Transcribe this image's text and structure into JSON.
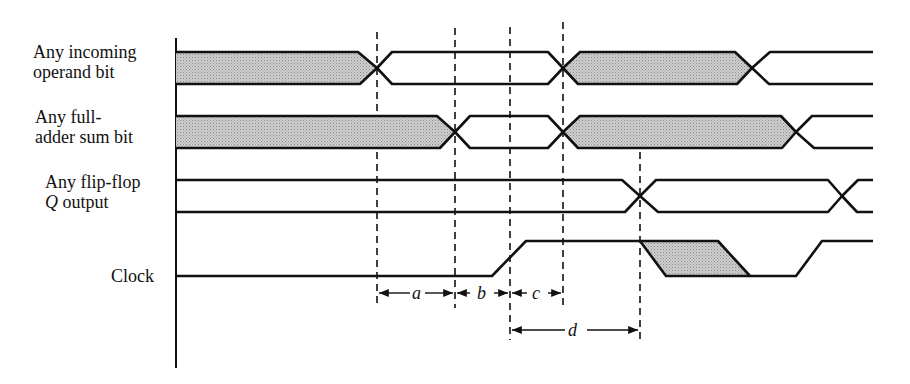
{
  "diagram": {
    "type": "timing-diagram",
    "signals": [
      {
        "id": "operand",
        "label_line1": "Any incoming",
        "label_line2": "operand bit"
      },
      {
        "id": "sum",
        "label_line1": "Any full-",
        "label_line2": "adder sum bit"
      },
      {
        "id": "flipflop",
        "label_line1": "Any flip-flop",
        "label_line2_italic": "Q",
        "label_line2_rest": " output"
      },
      {
        "id": "clock",
        "label_line1": "Clock"
      }
    ],
    "intervals": [
      {
        "name": "a",
        "from_marker": 1,
        "to_marker": 2
      },
      {
        "name": "b",
        "from_marker": 2,
        "to_marker": 3
      },
      {
        "name": "c",
        "from_marker": 3,
        "to_marker": 4
      },
      {
        "name": "d",
        "from_marker": 3,
        "to_marker": 5
      }
    ],
    "colors": {
      "line": "#111111",
      "hatch": "#b8b8b8",
      "background": "#ffffff"
    }
  }
}
